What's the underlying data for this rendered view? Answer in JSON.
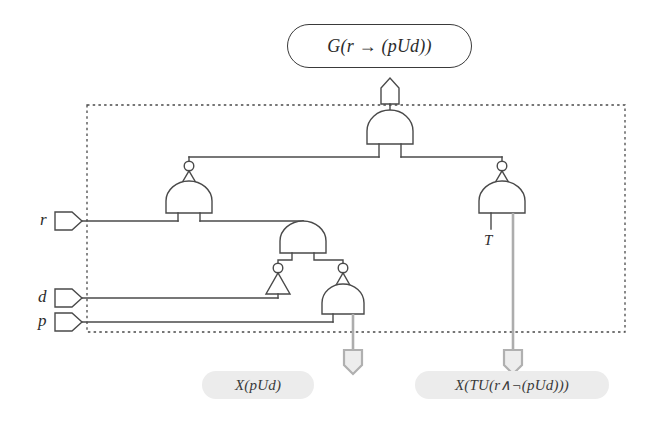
{
  "figure": {
    "kind": "logic-circuit-diagram",
    "top_formula": "G(r → (pUd))",
    "boundary_style": "dashed-rectangle"
  },
  "top_label": {
    "text": "G(r → (pUd))"
  },
  "inputs": [
    {
      "name": "input-r",
      "label": "r"
    },
    {
      "name": "input-d",
      "label": "d"
    },
    {
      "name": "input-p",
      "label": "p"
    }
  ],
  "internal_labels": [
    {
      "name": "constant-true",
      "label": "T"
    }
  ],
  "outputs": [
    {
      "name": "output-left",
      "label": "X(pUd)"
    },
    {
      "name": "output-right",
      "label": "X(TU(r∧¬(pUd)))"
    }
  ],
  "gates": [
    {
      "id": "and-top",
      "type": "AND",
      "x": 390,
      "y": 122
    },
    {
      "id": "not-left",
      "type": "NOT",
      "x": 189,
      "y": 172
    },
    {
      "id": "and-left",
      "type": "AND",
      "x": 189,
      "y": 194
    },
    {
      "id": "not-right",
      "type": "NOT",
      "x": 502,
      "y": 172
    },
    {
      "id": "and-right",
      "type": "AND",
      "x": 502,
      "y": 194
    },
    {
      "id": "and-mid",
      "type": "AND",
      "x": 303,
      "y": 232
    },
    {
      "id": "not-mid-left",
      "type": "NOT",
      "x": 278,
      "y": 268
    },
    {
      "id": "not-mid-right",
      "type": "NOT",
      "x": 343,
      "y": 268
    },
    {
      "id": "and-lower",
      "type": "AND",
      "x": 343,
      "y": 296
    }
  ],
  "colors": {
    "wire": "#4a4a4a",
    "wire_highlight": "#adadad",
    "gate_fill": "#ffffff",
    "label_fill": "#ececec",
    "text": "#2b2b2b",
    "background": "#ffffff"
  }
}
